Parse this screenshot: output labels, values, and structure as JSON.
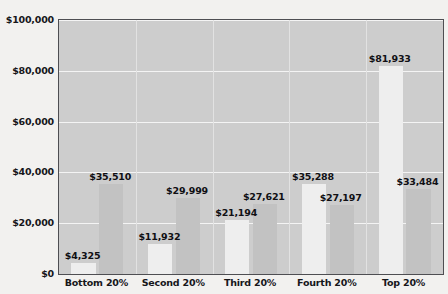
{
  "chart_data": {
    "type": "bar",
    "title": "",
    "xlabel": "",
    "ylabel": "",
    "ylim": [
      0,
      100000
    ],
    "grid": true,
    "legend_position": "none",
    "categories": [
      "Bottom 20%",
      "Second 20%",
      "Third 20%",
      "Fourth 20%",
      "Top 20%"
    ],
    "ytick_labels": [
      "$100,000",
      "$80,000",
      "$60,000",
      "$40,000",
      "$20,000",
      "$0"
    ],
    "ytick_values": [
      100000,
      80000,
      60000,
      40000,
      20000,
      0
    ],
    "series": [
      {
        "name": "series-1",
        "color": "#eeeeee",
        "values": [
          4325,
          11932,
          21194,
          35288,
          81933
        ],
        "data_labels": [
          "$4,325",
          "$11,932",
          "$21,194",
          "$35,288",
          "$81,933"
        ]
      },
      {
        "name": "series-2",
        "color": "#c2c2c2",
        "values": [
          35510,
          29999,
          27621,
          27197,
          33484
        ],
        "data_labels": [
          "$35,510",
          "$29,999",
          "$27,621",
          "$27,197",
          "$33,484"
        ]
      }
    ]
  },
  "style": {
    "page_background": "#f2f1ef",
    "plot_background": "#cdcdcd",
    "gridline_color": "#f4f4f4",
    "border_color": "#4e4e52",
    "text_color": "#16161a"
  }
}
